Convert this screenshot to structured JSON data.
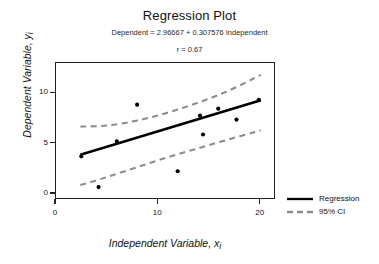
{
  "chart_data": {
    "type": "scatter",
    "title": "Regression Plot",
    "subtitle": "Dependent = 2.96667 + 0.307576 Independent",
    "annotation": "r = 0.67",
    "xlabel": "Independent Variable, x",
    "xlabel_sub": "i",
    "ylabel": "Dependent Variable, y",
    "ylabel_sub": "i",
    "xlim": [
      0,
      21.5
    ],
    "ylim": [
      -0.6,
      13.0
    ],
    "xticks": [
      0,
      10,
      20
    ],
    "yticks": [
      0,
      5,
      10
    ],
    "grid": false,
    "legend_position": "right",
    "intercept": 2.96667,
    "slope": 0.307576,
    "r": 0.67,
    "points": [
      {
        "x": 2.5,
        "y": 3.6
      },
      {
        "x": 4.2,
        "y": 0.5
      },
      {
        "x": 6.0,
        "y": 5.1
      },
      {
        "x": 8.0,
        "y": 8.8
      },
      {
        "x": 12.0,
        "y": 2.1
      },
      {
        "x": 14.2,
        "y": 7.7
      },
      {
        "x": 14.5,
        "y": 5.8
      },
      {
        "x": 16.0,
        "y": 8.4
      },
      {
        "x": 17.8,
        "y": 7.3
      },
      {
        "x": 20.0,
        "y": 9.3
      }
    ],
    "regression_line": [
      {
        "x": 2.4,
        "y": 3.75
      },
      {
        "x": 20.2,
        "y": 9.25
      }
    ],
    "ci_upper": [
      {
        "x": 2.4,
        "y": 6.6
      },
      {
        "x": 5.0,
        "y": 6.7
      },
      {
        "x": 8.0,
        "y": 7.2
      },
      {
        "x": 11.0,
        "y": 8.0
      },
      {
        "x": 14.0,
        "y": 9.0
      },
      {
        "x": 17.0,
        "y": 10.2
      },
      {
        "x": 20.2,
        "y": 11.8
      }
    ],
    "ci_lower": [
      {
        "x": 2.4,
        "y": 0.7
      },
      {
        "x": 5.0,
        "y": 1.5
      },
      {
        "x": 8.0,
        "y": 2.5
      },
      {
        "x": 11.0,
        "y": 3.5
      },
      {
        "x": 14.0,
        "y": 4.4
      },
      {
        "x": 17.0,
        "y": 5.3
      },
      {
        "x": 20.2,
        "y": 6.2
      }
    ],
    "series": [
      {
        "name": "Regression",
        "style": "solid",
        "color": "#000000"
      },
      {
        "name": "95% CI",
        "style": "dashed",
        "color": "#8c8c8c"
      }
    ]
  },
  "legend": {
    "regression_label": "Regression",
    "ci_label": "95% CI"
  },
  "colors": {
    "point": "#000000",
    "regression": "#000000",
    "ci": "#8c8c8c",
    "axis": "#222222",
    "background": "#ffffff"
  }
}
